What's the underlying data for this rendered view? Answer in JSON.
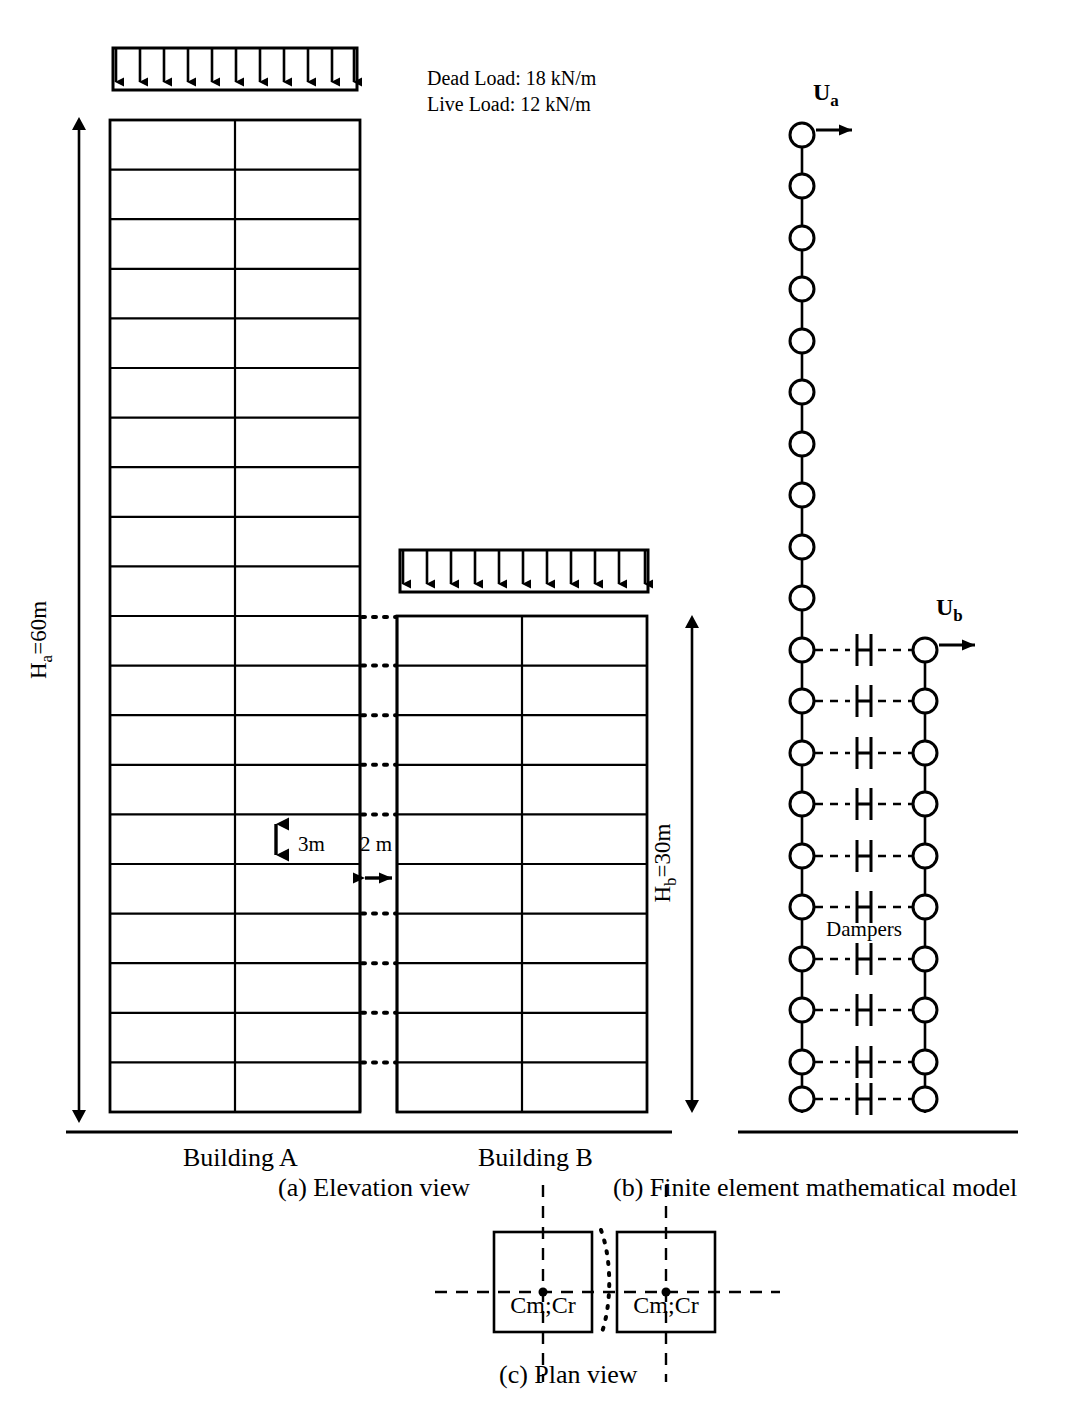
{
  "figure": {
    "line_color": "#000000",
    "background": "#ffffff"
  },
  "loads": {
    "dead_load_label": "Dead Load: 18 kN/m",
    "live_load_label": "Live Load: 12 kN/m",
    "arrow_count_building_a": 11,
    "arrow_count_building_b": 11
  },
  "elevation": {
    "caption": "(a) Elevation view",
    "building_a": {
      "name_label": "Building A",
      "height_label": "H",
      "height_sub": "a",
      "height_value": "=60m",
      "height_m": 60,
      "storeys": 20,
      "bays": 2
    },
    "building_b": {
      "name_label": "Building B",
      "height_label": "H",
      "height_sub": "b",
      "height_value": "=30m",
      "height_m": 30,
      "storeys": 10,
      "bays": 2
    },
    "storey_height_label": "3m",
    "storey_height_m": 3,
    "gap_label": "2 m",
    "gap_m": 2
  },
  "fe_model": {
    "caption": "(b) Finite element mathematical model",
    "displacement_a_label": "U",
    "displacement_a_sub": "a",
    "displacement_b_label": "U",
    "displacement_b_sub": "b",
    "dampers_label": "Dampers",
    "nodes_a": 20,
    "nodes_b": 10,
    "damper_count": 10
  },
  "plan": {
    "caption": "(c) Plan view",
    "block_a_label": "Cm;Cr",
    "block_b_label": "Cm;Cr"
  }
}
